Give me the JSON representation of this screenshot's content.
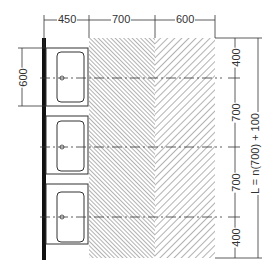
{
  "diagram": {
    "type": "plan-view dimension drawing",
    "colors": {
      "line": "#333333",
      "wall": "#111111",
      "hatch": "#555555",
      "background": "#ffffff"
    },
    "top_dimensions": [
      {
        "label": "450"
      },
      {
        "label": "700"
      },
      {
        "label": "600"
      }
    ],
    "left_dimension": {
      "label": "600"
    },
    "right_dimensions": [
      {
        "label": "400"
      },
      {
        "label": "700"
      },
      {
        "label": "700"
      },
      {
        "label": "400"
      }
    ],
    "total_length_label": "L = n(700) + 100",
    "basins": [
      {
        "name": "basin-1"
      },
      {
        "name": "basin-2"
      },
      {
        "name": "basin-3"
      }
    ],
    "zones": [
      {
        "name": "activity-zone",
        "hatch": "dense",
        "width_label": "700"
      },
      {
        "name": "circulation-zone",
        "hatch": "sparse",
        "width_label": "600"
      }
    ]
  }
}
